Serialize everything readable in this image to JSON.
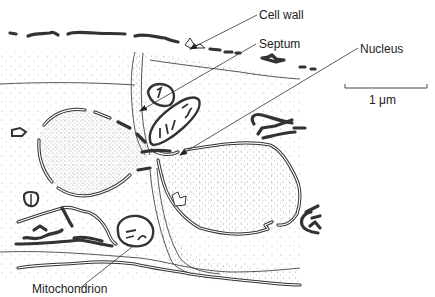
{
  "figure": {
    "type": "electron micrograph schematic"
  },
  "labels": {
    "cell_wall": "Cell wall",
    "septum": "Septum",
    "nucleus": "Nucleus",
    "mitochondrion": "Mitochondrion"
  },
  "scale_bar": {
    "label": "1 μm",
    "length_px": 82
  },
  "colors": {
    "ink": "#333333",
    "background": "#ffffff",
    "stipple": "#9a9a9a"
  }
}
